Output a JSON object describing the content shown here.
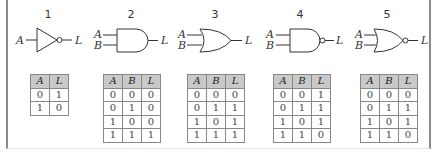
{
  "figure": {
    "gates": [
      {
        "number": "1",
        "type": "NOT",
        "inputs": [
          "A"
        ],
        "output": "L",
        "truth_table": {
          "headers": [
            "A",
            "L"
          ],
          "rows": [
            [
              "0",
              "1"
            ],
            [
              "1",
              "0"
            ]
          ]
        }
      },
      {
        "number": "2",
        "type": "AND",
        "inputs": [
          "A",
          "B"
        ],
        "output": "L",
        "truth_table": {
          "headers": [
            "A",
            "B",
            "L"
          ],
          "rows": [
            [
              "0",
              "0",
              "0"
            ],
            [
              "0",
              "1",
              "0"
            ],
            [
              "1",
              "0",
              "0"
            ],
            [
              "1",
              "1",
              "1"
            ]
          ]
        }
      },
      {
        "number": "3",
        "type": "OR",
        "inputs": [
          "A",
          "B"
        ],
        "output": "L",
        "truth_table": {
          "headers": [
            "A",
            "B",
            "L"
          ],
          "rows": [
            [
              "0",
              "0",
              "0"
            ],
            [
              "0",
              "1",
              "1"
            ],
            [
              "1",
              "0",
              "1"
            ],
            [
              "1",
              "1",
              "1"
            ]
          ]
        }
      },
      {
        "number": "4",
        "type": "NAND",
        "inputs": [
          "A",
          "B"
        ],
        "output": "L",
        "truth_table": {
          "headers": [
            "A",
            "B",
            "L"
          ],
          "rows": [
            [
              "0",
              "0",
              "1"
            ],
            [
              "0",
              "1",
              "1"
            ],
            [
              "1",
              "0",
              "1"
            ],
            [
              "1",
              "1",
              "0"
            ]
          ]
        }
      },
      {
        "number": "5",
        "type": "XOR",
        "inputs": [
          "A",
          "B"
        ],
        "output": "L",
        "truth_table": {
          "headers": [
            "A",
            "B",
            "L"
          ],
          "rows": [
            [
              "0",
              "0",
              "0"
            ],
            [
              "0",
              "1",
              "1"
            ],
            [
              "1",
              "0",
              "1"
            ],
            [
              "1",
              "1",
              "0"
            ]
          ]
        }
      }
    ],
    "colors": {
      "header_fill": "#c9c9c9",
      "frame_border": "#8a8a8a",
      "stroke": "#333333"
    }
  }
}
